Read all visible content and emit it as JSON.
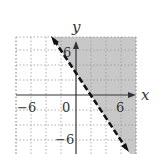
{
  "chart_data": {
    "type": "line",
    "title": "",
    "xlabel": "x",
    "ylabel": "y",
    "xlim": [
      -8,
      8
    ],
    "ylim": [
      -8,
      8
    ],
    "grid": true,
    "grid_step": 2,
    "x_ticks_labeled": [
      -6,
      0,
      6
    ],
    "y_ticks_labeled": [
      6,
      -6
    ],
    "tick_labels": {
      "x_neg": "−6",
      "origin": "0",
      "x_pos": "6",
      "y_pos": "6",
      "y_neg": "−6"
    },
    "boundary_line": {
      "equation": "y = -3/2 x + 3",
      "slope": -1.5,
      "intercept": 3,
      "style": "dashed",
      "points": [
        [
          -3.2,
          7.8
        ],
        [
          6.8,
          -7.2
        ]
      ]
    },
    "inequality": "y > -3/2 x + 3",
    "shaded_region": "above-right of line",
    "colors": {
      "shade": "#c8c8c8",
      "line": "#111111",
      "axis": "#333333",
      "grid": "#9a9a9a"
    }
  },
  "labels": {
    "x_axis": "x",
    "y_axis": "y",
    "x_neg": "−6",
    "origin": "0",
    "x_pos": "6",
    "y_pos": "6",
    "y_neg": "−6"
  }
}
